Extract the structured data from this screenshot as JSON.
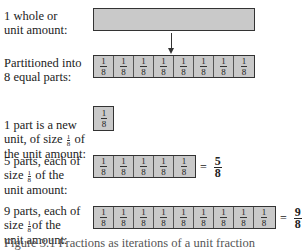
{
  "rows": [
    {
      "label": "1 whole or\nunit amount:"
    },
    {
      "label": "Partitioned into\n8 equal parts:"
    },
    {
      "label_pre": "1 part is a new\nunit, of size ",
      "label_post": " of\nthe unit amount:"
    },
    {
      "label_pre": "5 parts, each of\nsize ",
      "label_post": " of the\nunit amount:"
    },
    {
      "label_pre": "9 parts, each of\nsize ",
      "label_post": "of the\nunit amount:"
    }
  ],
  "unit_fraction": {
    "numerator": "1",
    "denominator": "8"
  },
  "results": {
    "five": {
      "sign": "=",
      "numerator": "5",
      "denominator": "8"
    },
    "nine": {
      "sign": "=",
      "numerator": "9",
      "denominator": "8"
    }
  },
  "colors": {
    "bar_fill": "#c9c9c9",
    "border": "#333333"
  },
  "caption": "Figure 3.1  Fractions as iterations of a unit fraction"
}
